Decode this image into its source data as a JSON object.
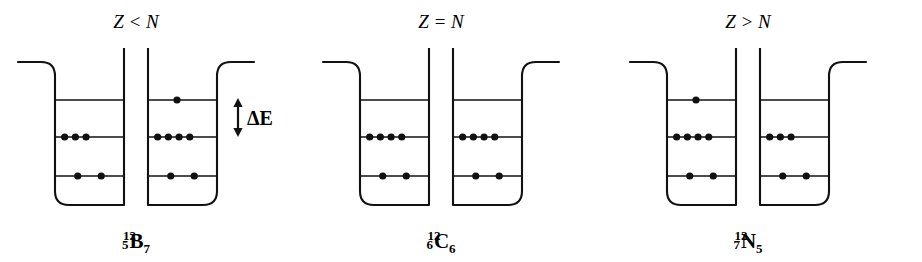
{
  "figure": {
    "caption_present": false,
    "background_color": "#ffffff",
    "ink_color": "#111111"
  },
  "deltaE": {
    "label": "ΔE",
    "icon": "double-headed-vertical-arrow"
  },
  "panels": [
    {
      "id": "panel-b12",
      "title": "Z < N",
      "nuclide": {
        "mass_number": "12",
        "atomic_number": "5",
        "symbol": "B",
        "neutron_number": "7"
      },
      "wells": [
        {
          "id": "proton-well",
          "kind": "protons",
          "total": 5,
          "levels": [
            {
              "name": "level-3",
              "occupancy": 0
            },
            {
              "name": "level-2",
              "occupancy": 3
            },
            {
              "name": "level-1",
              "occupancy": 2
            }
          ]
        },
        {
          "id": "neutron-well",
          "kind": "neutrons",
          "total": 7,
          "levels": [
            {
              "name": "level-3",
              "occupancy": 1
            },
            {
              "name": "level-2",
              "occupancy": 4
            },
            {
              "name": "level-1",
              "occupancy": 2
            }
          ]
        }
      ]
    },
    {
      "id": "panel-c12",
      "title": "Z = N",
      "nuclide": {
        "mass_number": "12",
        "atomic_number": "6",
        "symbol": "C",
        "neutron_number": "6"
      },
      "wells": [
        {
          "id": "proton-well",
          "kind": "protons",
          "total": 6,
          "levels": [
            {
              "name": "level-3",
              "occupancy": 0
            },
            {
              "name": "level-2",
              "occupancy": 4
            },
            {
              "name": "level-1",
              "occupancy": 2
            }
          ]
        },
        {
          "id": "neutron-well",
          "kind": "neutrons",
          "total": 6,
          "levels": [
            {
              "name": "level-3",
              "occupancy": 0
            },
            {
              "name": "level-2",
              "occupancy": 4
            },
            {
              "name": "level-1",
              "occupancy": 2
            }
          ]
        }
      ]
    },
    {
      "id": "panel-n12",
      "title": "Z > N",
      "nuclide": {
        "mass_number": "12",
        "atomic_number": "7",
        "symbol": "N",
        "neutron_number": "5"
      },
      "wells": [
        {
          "id": "proton-well",
          "kind": "protons",
          "total": 7,
          "levels": [
            {
              "name": "level-3",
              "occupancy": 1
            },
            {
              "name": "level-2",
              "occupancy": 4
            },
            {
              "name": "level-1",
              "occupancy": 2
            }
          ]
        },
        {
          "id": "neutron-well",
          "kind": "neutrons",
          "total": 5,
          "levels": [
            {
              "name": "level-3",
              "occupancy": 0
            },
            {
              "name": "level-2",
              "occupancy": 3
            },
            {
              "name": "level-1",
              "occupancy": 2
            }
          ]
        }
      ]
    }
  ]
}
